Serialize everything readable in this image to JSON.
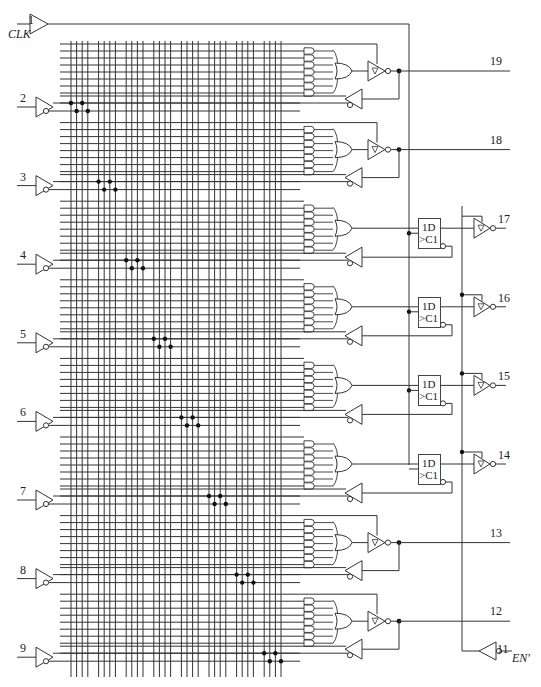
{
  "diagram": {
    "line_color": "#333333",
    "dot_color": "#111111"
  },
  "clock": {
    "pin": "1",
    "label": "CLK"
  },
  "enable": {
    "pin": "11",
    "label": "EN'"
  },
  "inputs": [
    {
      "pin": "2"
    },
    {
      "pin": "3"
    },
    {
      "pin": "4"
    },
    {
      "pin": "5"
    },
    {
      "pin": "6"
    },
    {
      "pin": "7"
    },
    {
      "pin": "8"
    },
    {
      "pin": "9"
    }
  ],
  "macrocells": [
    {
      "pin": "19",
      "type": "combinational"
    },
    {
      "pin": "18",
      "type": "combinational"
    },
    {
      "pin": "17",
      "type": "registered",
      "ff_d": "1D",
      "ff_c": "C1"
    },
    {
      "pin": "16",
      "type": "registered",
      "ff_d": "1D",
      "ff_c": "C1"
    },
    {
      "pin": "15",
      "type": "registered",
      "ff_d": "1D",
      "ff_c": "C1"
    },
    {
      "pin": "14",
      "type": "registered",
      "ff_d": "1D",
      "ff_c": "C1"
    },
    {
      "pin": "13",
      "type": "combinational"
    },
    {
      "pin": "12",
      "type": "combinational"
    }
  ],
  "grid": {
    "columns": 32,
    "column_groups": 8,
    "product_terms_per_block": 8
  }
}
